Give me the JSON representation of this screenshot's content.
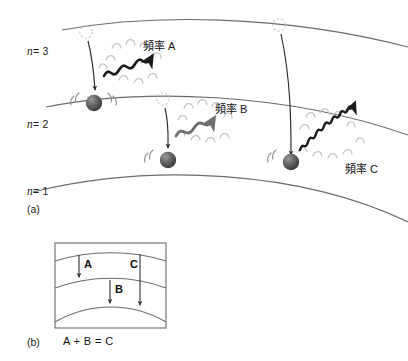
{
  "figure": {
    "background_color": "#ffffff",
    "orbit_stroke": "#6b6b6b",
    "wave_dark_color": "#1a1a1a",
    "wave_mid_color": "#6e6e6e",
    "flourish_color": "#bdbdbd",
    "electron_color": "#555555",
    "arrow_color": "#2b2b2b"
  },
  "panel_a": {
    "caption": "(a)",
    "levels": [
      {
        "name": "n3",
        "label_prefix": "n",
        "label_eq": "= 3",
        "label_full": "n = 3"
      },
      {
        "name": "n2",
        "label_prefix": "n",
        "label_eq": "= 2",
        "label_full": "n = 2"
      },
      {
        "name": "n1",
        "label_prefix": "n",
        "label_eq": "= 1",
        "label_full": "n = 1"
      }
    ],
    "transitions": [
      {
        "id": "A",
        "label": "頻率 A",
        "from_level": "n = 3",
        "to_level": "n = 2",
        "wave_cycles": 4,
        "wave_style": "dark"
      },
      {
        "id": "B",
        "label": "頻率 B",
        "from_level": "n = 2",
        "to_level": "n = 1",
        "wave_cycles": 3,
        "wave_style": "mid"
      },
      {
        "id": "C",
        "label": "頻率 C",
        "from_level": "n = 3",
        "to_level": "n = 1",
        "wave_cycles": 7,
        "wave_style": "dark"
      }
    ]
  },
  "panel_b": {
    "caption": "(b)",
    "equation": "A + B = C",
    "arrows": [
      {
        "id": "A",
        "label": "A",
        "from": "outer",
        "to": "middle"
      },
      {
        "id": "B",
        "label": "B",
        "from": "middle",
        "to": "inner"
      },
      {
        "id": "C",
        "label": "C",
        "from": "outer",
        "to": "inner"
      }
    ]
  }
}
